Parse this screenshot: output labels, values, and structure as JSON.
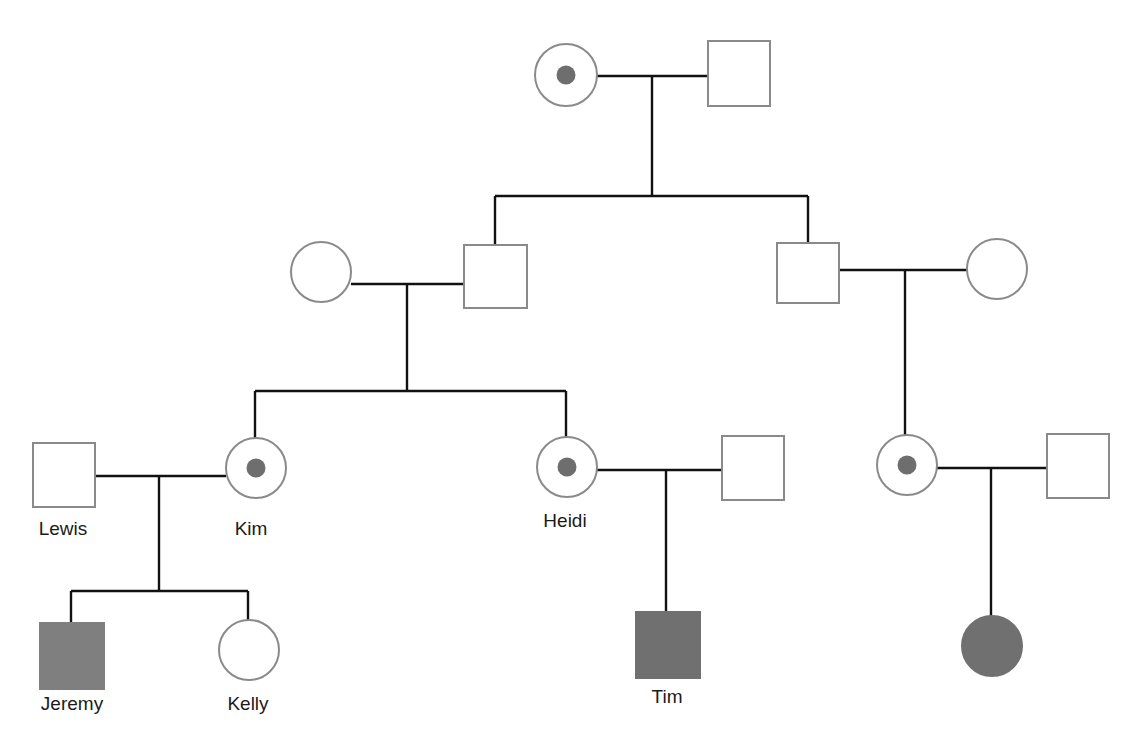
{
  "diagram": {
    "type": "pedigree",
    "colors": {
      "line": "#111111",
      "outline": "#8a8a8a",
      "affected_fill": "#777777",
      "carrier_dot": "#6e6e6e",
      "background": "#ffffff"
    },
    "individuals": [
      {
        "id": "g1-female",
        "sex": "female",
        "status": "carrier",
        "label": ""
      },
      {
        "id": "g1-male",
        "sex": "male",
        "status": "unaffected",
        "label": ""
      },
      {
        "id": "g2-spouse-female-left",
        "sex": "female",
        "status": "unaffected",
        "label": ""
      },
      {
        "id": "g2-son-left",
        "sex": "male",
        "status": "unaffected",
        "label": ""
      },
      {
        "id": "g2-son-right",
        "sex": "male",
        "status": "unaffected",
        "label": ""
      },
      {
        "id": "g2-spouse-female-right",
        "sex": "female",
        "status": "unaffected",
        "label": ""
      },
      {
        "id": "lewis",
        "sex": "male",
        "status": "unaffected",
        "label": "Lewis"
      },
      {
        "id": "kim",
        "sex": "female",
        "status": "carrier",
        "label": "Kim"
      },
      {
        "id": "heidi",
        "sex": "female",
        "status": "carrier",
        "label": "Heidi"
      },
      {
        "id": "heidi-spouse",
        "sex": "male",
        "status": "unaffected",
        "label": ""
      },
      {
        "id": "g3-cousin-female",
        "sex": "female",
        "status": "carrier",
        "label": ""
      },
      {
        "id": "g3-cousin-spouse",
        "sex": "male",
        "status": "unaffected",
        "label": ""
      },
      {
        "id": "jeremy",
        "sex": "male",
        "status": "affected",
        "label": "Jeremy"
      },
      {
        "id": "kelly",
        "sex": "female",
        "status": "unaffected",
        "label": "Kelly"
      },
      {
        "id": "tim",
        "sex": "male",
        "status": "affected",
        "label": "Tim"
      },
      {
        "id": "g4-female-affected",
        "sex": "female",
        "status": "affected",
        "label": ""
      }
    ],
    "labels": {
      "lewis": "Lewis",
      "kim": "Kim",
      "heidi": "Heidi",
      "jeremy": "Jeremy",
      "kelly": "Kelly",
      "tim": "Tim"
    }
  }
}
